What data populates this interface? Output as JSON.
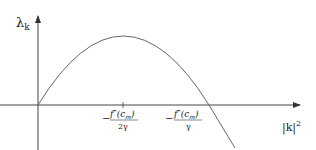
{
  "diagram": {
    "type": "function-plot",
    "y_axis_label": "λ",
    "y_axis_label_sub": "k",
    "x_axis_label": "|k|",
    "x_axis_label_sup": "2",
    "tick_label_1": {
      "minus": "−",
      "numerator": "f″(c",
      "numerator_sub": "m",
      "numerator_close": ")",
      "denominator": "2γ"
    },
    "tick_label_2": {
      "minus": "−",
      "numerator": "f″(c",
      "numerator_sub": "m",
      "numerator_close": ")",
      "denominator": "γ"
    },
    "curve_description": "Concave-down parabola starting at origin, peaking at −f''(c_m)/2γ, crossing zero at −f''(c_m)/γ",
    "colors": {
      "axis": "#444444",
      "curve": "#555555",
      "text": "#222222"
    }
  }
}
